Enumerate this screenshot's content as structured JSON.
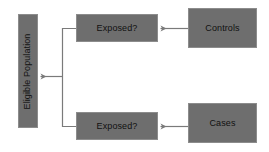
{
  "diagram": {
    "background_color": "#ffffff",
    "node_fill_color": "#6e6e6e",
    "node_border_color": "#8c8c8c",
    "node_text_color": "#111111",
    "connector_color": "#7a7a7a",
    "nodes": [
      {
        "id": "eligible-population",
        "label": "Eligible Population",
        "orientation": "vertical"
      },
      {
        "id": "exposed-top",
        "label": "Exposed?",
        "orientation": "horizontal"
      },
      {
        "id": "exposed-bottom",
        "label": "Exposed?",
        "orientation": "horizontal"
      },
      {
        "id": "controls",
        "label": "Controls",
        "orientation": "horizontal"
      },
      {
        "id": "cases",
        "label": "Cases",
        "orientation": "horizontal"
      }
    ],
    "edges": [
      {
        "id": "controls-to-exposed-top",
        "from": "controls",
        "to": "exposed-top",
        "direction": "left",
        "arrowhead": true
      },
      {
        "id": "cases-to-exposed-bottom",
        "from": "cases",
        "to": "exposed-bottom",
        "direction": "left",
        "arrowhead": true
      },
      {
        "id": "exposed-to-eligible-population",
        "from": "exposed-top,exposed-bottom",
        "to": "eligible-population",
        "direction": "left",
        "arrowhead": true,
        "style": "bracket"
      }
    ]
  }
}
